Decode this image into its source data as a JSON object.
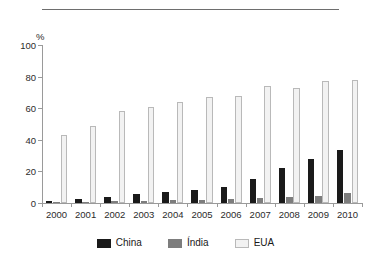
{
  "chart_data": {
    "type": "bar",
    "title": "",
    "xlabel": "",
    "ylabel": "%",
    "ylim": [
      0,
      100
    ],
    "yticks": [
      0,
      20,
      40,
      60,
      80,
      100
    ],
    "grid": false,
    "legend_position": "bottom",
    "categories": [
      "2000",
      "2001",
      "2002",
      "2003",
      "2004",
      "2005",
      "2006",
      "2007",
      "2008",
      "2009",
      "2010"
    ],
    "series": [
      {
        "name": "China",
        "color": "#1a1a1a",
        "values": [
          1.5,
          2.5,
          4,
          5.5,
          7,
          8.5,
          10,
          15.5,
          22,
          28,
          33.5
        ]
      },
      {
        "name": "Índia",
        "color": "#7d7d7d",
        "values": [
          0.5,
          0.8,
          1.2,
          1.3,
          1.6,
          2,
          2.5,
          3,
          3.5,
          4.5,
          6.5
        ]
      },
      {
        "name": "EUA",
        "color": "#f2f2f2",
        "values": [
          43,
          49,
          58,
          61,
          64,
          67,
          68,
          74,
          73,
          77,
          78
        ]
      }
    ]
  },
  "axis": {
    "y_unit": "%"
  }
}
